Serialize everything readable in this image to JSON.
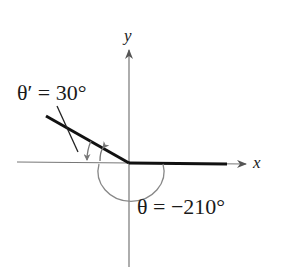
{
  "diagram": {
    "axes": {
      "x_label": "x",
      "y_label": "y"
    },
    "reference_angle_label": "θ′ = 30°",
    "angle_label": "θ = −210°",
    "colors": {
      "terminal_side": "#111111",
      "axis": "#6e6e6e",
      "arc": "#7a7a7a"
    }
  }
}
